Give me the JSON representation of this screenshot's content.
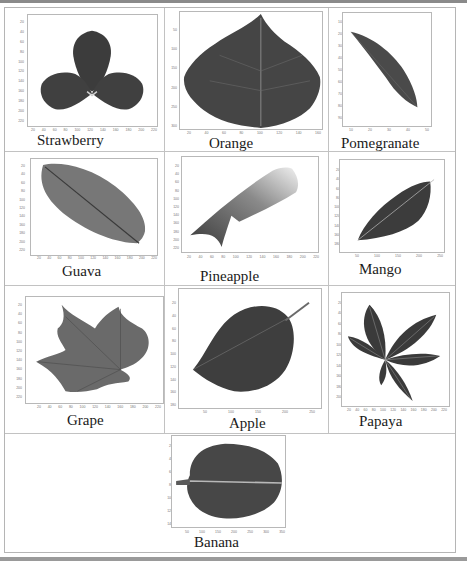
{
  "figure": {
    "panels": [
      {
        "label": "Strawberry",
        "yticks": [
          "20",
          "40",
          "60",
          "80",
          "100",
          "120",
          "140",
          "160",
          "180",
          "200",
          "220"
        ],
        "xticks": [
          "20",
          "40",
          "60",
          "80",
          "100",
          "120",
          "140",
          "160",
          "180",
          "200",
          "220"
        ]
      },
      {
        "label": "Orange",
        "yticks": [
          "50",
          "100",
          "150",
          "200",
          "250",
          "300"
        ],
        "xticks": [
          "20",
          "40",
          "60",
          "80",
          "100",
          "120",
          "140",
          "160"
        ]
      },
      {
        "label": "Pomegranate",
        "yticks": [
          "10",
          "20",
          "30",
          "40",
          "50",
          "60",
          "70",
          "80",
          "90"
        ],
        "xticks": [
          "10",
          "20",
          "30",
          "40",
          "50"
        ]
      },
      {
        "label": "Guava",
        "yticks": [
          "20",
          "40",
          "60",
          "80",
          "100",
          "120",
          "140",
          "160",
          "180",
          "200",
          "220"
        ],
        "xticks": [
          "20",
          "40",
          "60",
          "80",
          "100",
          "120",
          "140",
          "160",
          "180",
          "200",
          "220"
        ]
      },
      {
        "label": "Pineapple",
        "yticks": [
          "20",
          "40",
          "60",
          "80",
          "100",
          "120",
          "140",
          "160",
          "180",
          "200",
          "220"
        ],
        "xticks": [
          "20",
          "40",
          "60",
          "80",
          "100",
          "120",
          "140",
          "160",
          "180",
          "200",
          "220"
        ]
      },
      {
        "label": "Mango",
        "yticks": [
          "20",
          "40",
          "60",
          "80",
          "100",
          "120",
          "140",
          "160",
          "180"
        ],
        "xticks": [
          "50",
          "100",
          "150",
          "200",
          "250"
        ]
      },
      {
        "label": "Grape",
        "yticks": [
          "20",
          "40",
          "60",
          "80",
          "100",
          "120",
          "140",
          "160",
          "180",
          "200",
          "220"
        ],
        "xticks": [
          "20",
          "40",
          "60",
          "80",
          "100",
          "120",
          "140",
          "160",
          "180",
          "200",
          "220"
        ]
      },
      {
        "label": "Apple",
        "yticks": [
          "20",
          "40",
          "60",
          "80",
          "100",
          "120",
          "140",
          "160",
          "180"
        ],
        "xticks": [
          "50",
          "100",
          "150",
          "200",
          "250"
        ]
      },
      {
        "label": "Papaya",
        "yticks": [
          "20",
          "40",
          "60",
          "80",
          "100",
          "120",
          "140",
          "160",
          "180",
          "200"
        ],
        "xticks": [
          "20",
          "40",
          "60",
          "80",
          "100",
          "120",
          "140",
          "160",
          "180",
          "200",
          "220"
        ]
      },
      {
        "label": "Banana",
        "yticks": [
          "20",
          "40",
          "60",
          "80",
          "100",
          "120",
          "140"
        ],
        "xticks": [
          "50",
          "100",
          "150",
          "200",
          "250",
          "300",
          "350"
        ]
      }
    ]
  }
}
